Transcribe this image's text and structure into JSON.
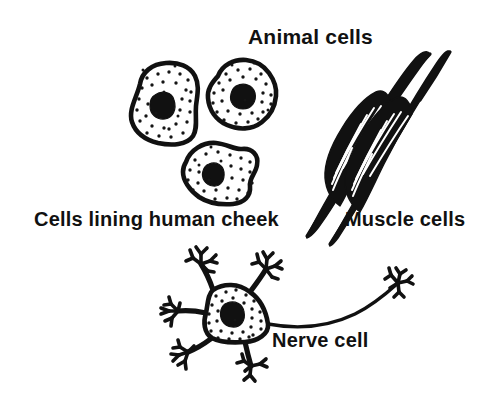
{
  "figure": {
    "title": "Animal cells",
    "background_color": "#ffffff",
    "ink_color": "#111111",
    "labels": {
      "title": "Animal cells",
      "cheek": "Cells lining human cheek",
      "muscle": "Muscle cells",
      "nerve": "Nerve cell"
    },
    "panels": [
      {
        "name": "cheek-cells",
        "label": "Cells lining human cheek",
        "cell_count": 3,
        "description": "Three irregular flattened squamous cells with stippled cytoplasm and a dark rounded nucleus each"
      },
      {
        "name": "muscle-cells",
        "label": "Muscle cells",
        "cell_count": 2,
        "description": "Two long tapering spindle-shaped striated fibres running diagonally"
      },
      {
        "name": "nerve-cell",
        "label": "Nerve cell",
        "cell_count": 1,
        "description": "Star-shaped stippled cell body with a dark nucleus, five branched dendrites and one long axon ending in a branched terminal"
      }
    ]
  }
}
